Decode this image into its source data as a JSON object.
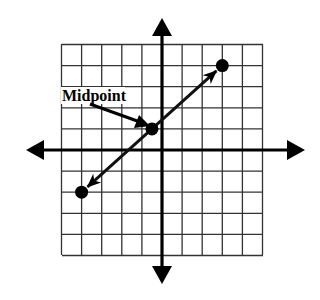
{
  "figure": {
    "type": "coordinate-plane-diagram",
    "grid": {
      "x_min": -5,
      "x_max": 5,
      "y_min": -5,
      "y_max": 5,
      "cells_x": 10,
      "cells_y": 10,
      "axis_arrows": true
    },
    "points": [
      {
        "name": "endpoint-a",
        "x": -4,
        "y": -2
      },
      {
        "name": "midpoint",
        "x": -0.5,
        "y": 1
      },
      {
        "name": "endpoint-b",
        "x": 3,
        "y": 4
      }
    ],
    "segment": {
      "from": [
        -4,
        -2
      ],
      "to": [
        3,
        4
      ],
      "arrowheads": "both-ends-toward-points"
    },
    "annotation": {
      "label": "Midpoint",
      "points_to": "midpoint"
    },
    "colors": {
      "background": "#ffffff",
      "ink": "#000000",
      "grid": "#333333"
    }
  }
}
